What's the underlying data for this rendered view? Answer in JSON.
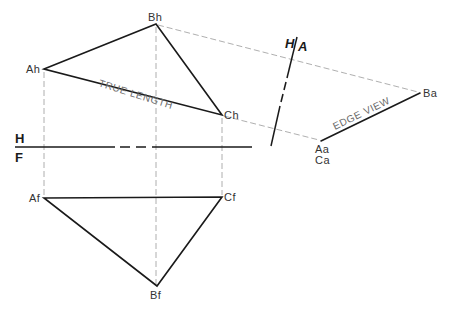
{
  "diagram": {
    "type": "descriptive-geometry-auxiliary-view",
    "colors": {
      "object_line": "#1a1a1a",
      "projection_line": "#9a9a9a",
      "label": "#333333",
      "annotation": "#6a6a6a"
    },
    "fold_lines": {
      "hf": {
        "upper": "H",
        "lower": "F"
      },
      "ha": {
        "left": "H",
        "right": "A"
      }
    },
    "points": {
      "Ah": {
        "label": "Ah",
        "x": 44,
        "y": 69
      },
      "Bh": {
        "label": "Bh",
        "x": 156,
        "y": 24
      },
      "Ch": {
        "label": "Ch",
        "x": 222,
        "y": 115
      },
      "Af": {
        "label": "Af",
        "x": 44,
        "y": 198
      },
      "Bf": {
        "label": "Bf",
        "x": 157,
        "y": 286
      },
      "Cf": {
        "label": "Cf",
        "x": 222,
        "y": 197
      },
      "Aa": {
        "label": "Aa",
        "x": 321,
        "y": 141
      },
      "Ca": {
        "label": "Ca"
      },
      "Ba": {
        "label": "Ba",
        "x": 420,
        "y": 93
      }
    },
    "annotations": {
      "true_length": "TRUE LENGTH",
      "edge_view": "EDGE VIEW"
    }
  }
}
